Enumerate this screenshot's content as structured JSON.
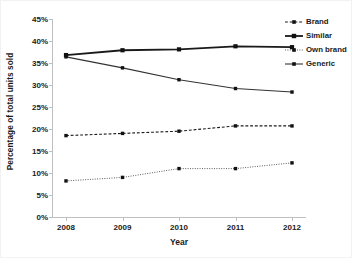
{
  "chart_data": {
    "type": "line",
    "title": "",
    "xlabel": "Year",
    "ylabel": "Percentage of total units sold",
    "categories": [
      "2008",
      "2009",
      "2010",
      "2011",
      "2012"
    ],
    "x": [
      2008,
      2009,
      2010,
      2011,
      2012
    ],
    "ylim": [
      0,
      45
    ],
    "xlim": [
      2008,
      2012
    ],
    "y_tick_labels": [
      "0%",
      "5%",
      "10%",
      "15%",
      "20%",
      "25%",
      "30%",
      "35%",
      "40%",
      "45%"
    ],
    "y_tick_values": [
      0,
      5,
      10,
      15,
      20,
      25,
      30,
      35,
      40,
      45
    ],
    "x_tick_labels": [
      "2008",
      "2009",
      "2010",
      "2011",
      "2012"
    ],
    "grid": false,
    "legend_position": "upper right",
    "series": [
      {
        "name": "Brand",
        "values": [
          18.5,
          19.0,
          19.5,
          20.7,
          20.7
        ],
        "line_style": "dashed",
        "marker": "square",
        "color": "#1a1a1a",
        "line_width": 1.1
      },
      {
        "name": "Similar",
        "values": [
          36.8,
          37.9,
          38.1,
          38.8,
          38.6
        ],
        "line_style": "solid",
        "marker": "square",
        "color": "#1a1a1a",
        "line_width": 1.8
      },
      {
        "name": "Own brand",
        "values": [
          8.2,
          9.0,
          11.0,
          11.0,
          12.3
        ],
        "line_style": "dotted",
        "marker": "square",
        "color": "#555555",
        "line_width": 1.0
      },
      {
        "name": "Generic",
        "values": [
          36.4,
          33.9,
          31.2,
          29.2,
          28.4
        ],
        "line_style": "solid",
        "marker": "square",
        "color": "#333333",
        "line_width": 1.1
      }
    ]
  },
  "axes": {
    "y_title": "Percentage of total units sold",
    "x_title": "Year"
  },
  "legend": {
    "items": [
      {
        "label": "Brand"
      },
      {
        "label": "Similar"
      },
      {
        "label": "Own brand"
      },
      {
        "label": "Generic"
      }
    ]
  },
  "colors": {
    "axis": "#bfbfbf",
    "text": "#1a1a1a",
    "background": "#ffffff"
  }
}
